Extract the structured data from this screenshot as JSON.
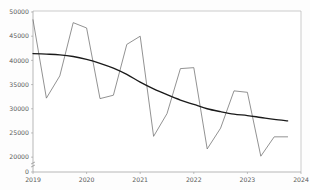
{
  "chart_data": {
    "type": "line",
    "title": "",
    "subtitle": "",
    "xlabel": "",
    "ylabel": "",
    "xlim": [
      2019.0,
      2024.0
    ],
    "ylim": [
      19000,
      50000
    ],
    "grid": false,
    "legend_position": "none",
    "y_axis_broken_at_zero": true,
    "x_ticks": [
      2019,
      2020,
      2021,
      2022,
      2023,
      2024
    ],
    "x_tick_labels": [
      "2019",
      "2020",
      "2021",
      "2022",
      "2023",
      "2024"
    ],
    "y_ticks": [
      0,
      20000,
      25000,
      30000,
      35000,
      40000,
      45000,
      50000
    ],
    "y_tick_labels": [
      "0",
      "20000",
      "25000",
      "30000",
      "35000",
      "40000",
      "45000",
      "50000"
    ],
    "series": [
      {
        "name": "observed",
        "color": "#6e6e6e",
        "x": [
          2019.0,
          2019.25,
          2019.5,
          2019.75,
          2020.0,
          2020.25,
          2020.5,
          2020.75,
          2021.0,
          2021.25,
          2021.5,
          2021.75,
          2022.0,
          2022.25,
          2022.5,
          2022.75,
          2023.0,
          2023.25,
          2023.5,
          2023.75
        ],
        "values": [
          48400,
          32200,
          36800,
          47800,
          46700,
          32100,
          32800,
          43300,
          45000,
          24300,
          29000,
          38300,
          38500,
          21700,
          26000,
          33700,
          33400,
          20200,
          24200,
          24200
        ]
      },
      {
        "name": "trend",
        "color": "#1a1a1a",
        "x": [
          2019.0,
          2019.25,
          2019.5,
          2019.75,
          2020.0,
          2020.25,
          2020.5,
          2020.75,
          2021.0,
          2021.25,
          2021.5,
          2021.75,
          2022.0,
          2022.25,
          2022.5,
          2022.75,
          2023.0,
          2023.25,
          2023.5,
          2023.75
        ],
        "values": [
          41400,
          41300,
          41150,
          40800,
          40200,
          39400,
          38400,
          37100,
          35500,
          34100,
          32900,
          31800,
          30900,
          30000,
          29400,
          28900,
          28600,
          28200,
          27800,
          27500
        ]
      }
    ]
  },
  "axis": {
    "zero_label": "0"
  }
}
